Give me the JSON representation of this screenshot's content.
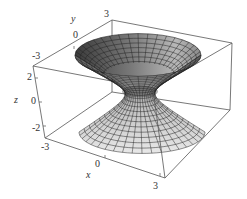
{
  "chart_data": {
    "type": "surface3d",
    "title": "",
    "surface": "hyperboloid of one sheet",
    "equation_hint": "x^2 + y^2 - z^2 = 1",
    "axes": {
      "x": {
        "label": "x",
        "ticks": [
          "-3",
          "0",
          "3"
        ],
        "range": [
          -3,
          3
        ]
      },
      "y": {
        "label": "y",
        "ticks": [
          "-3",
          "0",
          "3"
        ],
        "range": [
          -3,
          3
        ]
      },
      "z": {
        "label": "z",
        "ticks": [
          "-2",
          "0",
          "2"
        ],
        "range": [
          -3,
          3
        ]
      }
    },
    "box": true,
    "grid": false,
    "mesh": {
      "rings": 22,
      "meridians": 40
    },
    "colors": {
      "surface_light": "#e6e6e6",
      "surface_dark": "#3a3a3a",
      "mesh_line": "#222222",
      "box_line": "#555555"
    }
  },
  "labels": {
    "x_axis": "x",
    "y_axis": "y",
    "z_axis": "z",
    "x_ticks": [
      "0",
      "3"
    ],
    "y_ticks": [
      "-3",
      "0",
      "3"
    ],
    "z_ticks": [
      "2",
      "0",
      "-2"
    ],
    "corner_x_neg": "-3"
  }
}
